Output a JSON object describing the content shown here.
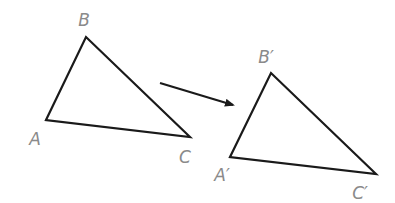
{
  "diagram": {
    "stroke_color": "#1a1a1a",
    "label_color": "#8a8a8a",
    "original": {
      "vertices": {
        "A": {
          "x": 46,
          "y": 120
        },
        "B": {
          "x": 86,
          "y": 37
        },
        "C": {
          "x": 190,
          "y": 137
        }
      },
      "labels": [
        {
          "text": "B",
          "x": 84,
          "y": 20
        },
        {
          "text": "A",
          "x": 35,
          "y": 139
        },
        {
          "text": "C",
          "x": 185,
          "y": 157
        }
      ]
    },
    "image": {
      "vertices": {
        "A'": {
          "x": 230,
          "y": 157
        },
        "B'": {
          "x": 271,
          "y": 73
        },
        "C'": {
          "x": 376,
          "y": 174
        }
      },
      "labels": [
        {
          "text": "B′",
          "x": 266,
          "y": 57
        },
        {
          "text": "A′",
          "x": 222,
          "y": 175
        },
        {
          "text": "C′",
          "x": 360,
          "y": 193
        }
      ]
    },
    "arrow": {
      "from": {
        "x": 160,
        "y": 83
      },
      "to": {
        "x": 235,
        "y": 106
      }
    }
  }
}
